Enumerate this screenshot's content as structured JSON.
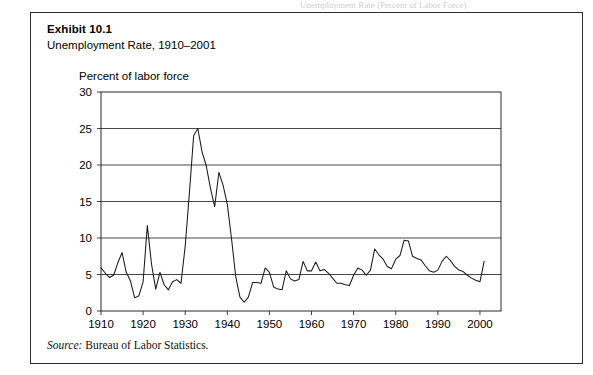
{
  "page": {
    "top_cut_text": "Unemployment Rate (Percent of Labor Force)"
  },
  "exhibit": {
    "label": "Exhibit 10.1",
    "subtitle": "Unemployment Rate, 1910–2001"
  },
  "source": {
    "prefix": "Source:",
    "text": "Bureau of Labor Statistics."
  },
  "colors": {
    "line": "#1a1a1a",
    "frame": "#2b2b2b",
    "grid": "#333333",
    "text": "#000000",
    "background": "#ffffff"
  },
  "chart_data": {
    "type": "line",
    "title": "Unemployment Rate, 1910–2001",
    "ylabel": "Percent of labor force",
    "xlabel": "",
    "ylim": [
      0,
      30
    ],
    "xlim": [
      1910,
      2001
    ],
    "yticks": [
      0,
      5,
      10,
      15,
      20,
      25,
      30
    ],
    "xticks": [
      1910,
      1920,
      1930,
      1940,
      1950,
      1960,
      1970,
      1980,
      1990,
      2000
    ],
    "grid": "horizontal",
    "legend": "none",
    "series": [
      {
        "name": "Unemployment Rate",
        "x": [
          1910,
          1911,
          1912,
          1913,
          1914,
          1915,
          1916,
          1917,
          1918,
          1919,
          1920,
          1921,
          1922,
          1923,
          1924,
          1925,
          1926,
          1927,
          1928,
          1929,
          1930,
          1931,
          1932,
          1933,
          1934,
          1935,
          1936,
          1937,
          1938,
          1939,
          1940,
          1941,
          1942,
          1943,
          1944,
          1945,
          1946,
          1947,
          1948,
          1949,
          1950,
          1951,
          1952,
          1953,
          1954,
          1955,
          1956,
          1957,
          1958,
          1959,
          1960,
          1961,
          1962,
          1963,
          1964,
          1965,
          1966,
          1967,
          1968,
          1969,
          1970,
          1971,
          1972,
          1973,
          1974,
          1975,
          1976,
          1977,
          1978,
          1979,
          1980,
          1981,
          1982,
          1983,
          1984,
          1985,
          1986,
          1987,
          1988,
          1989,
          1990,
          1991,
          1992,
          1993,
          1994,
          1995,
          1996,
          1997,
          1998,
          1999,
          2000,
          2001
        ],
        "y": [
          5.9,
          5.2,
          4.6,
          4.9,
          6.6,
          8.0,
          5.3,
          4.1,
          1.8,
          2.1,
          4.0,
          11.7,
          6.4,
          3.0,
          5.3,
          3.6,
          2.9,
          4.0,
          4.3,
          3.8,
          8.9,
          16.2,
          24.0,
          25.0,
          21.8,
          19.9,
          16.8,
          14.3,
          19.0,
          17.2,
          14.6,
          9.9,
          4.7,
          1.9,
          1.2,
          1.9,
          3.9,
          3.9,
          3.8,
          5.9,
          5.3,
          3.3,
          3.0,
          2.9,
          5.5,
          4.4,
          4.1,
          4.3,
          6.8,
          5.5,
          5.5,
          6.7,
          5.5,
          5.7,
          5.2,
          4.5,
          3.8,
          3.8,
          3.6,
          3.5,
          4.9,
          5.9,
          5.6,
          4.9,
          5.6,
          8.5,
          7.7,
          7.1,
          6.1,
          5.8,
          7.1,
          7.6,
          9.7,
          9.6,
          7.5,
          7.2,
          7.0,
          6.2,
          5.5,
          5.3,
          5.6,
          6.8,
          7.5,
          6.9,
          6.1,
          5.6,
          5.4,
          4.9,
          4.5,
          4.2,
          4.0,
          6.8
        ]
      }
    ]
  }
}
